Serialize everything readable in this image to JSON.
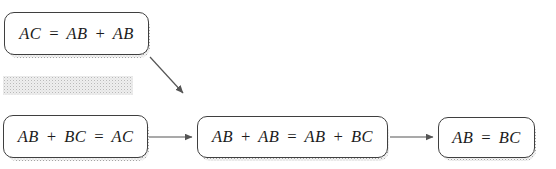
{
  "diagram": {
    "type": "flowchart",
    "nodes": [
      {
        "id": "node-1",
        "label": "AC = AB + AB"
      },
      {
        "id": "node-2",
        "label": "AB + BC = AC"
      },
      {
        "id": "node-3",
        "label": "AB + AB = AB + BC"
      },
      {
        "id": "node-4",
        "label": "AB = BC"
      }
    ],
    "edges": [
      {
        "from": "node-1",
        "to": "node-3",
        "direction": "diagonal-down-right"
      },
      {
        "from": "node-2",
        "to": "node-3",
        "direction": "right"
      },
      {
        "from": "node-3",
        "to": "node-4",
        "direction": "right"
      }
    ],
    "colors": {
      "background": "#ffffff",
      "node_border": "#3f3f3f",
      "node_fill": "#ffffff",
      "text": "#1c1c1c",
      "arrow": "#555555",
      "shadow_dots": "#a3a3a3",
      "redacted_fill": "#eeeeee"
    }
  }
}
